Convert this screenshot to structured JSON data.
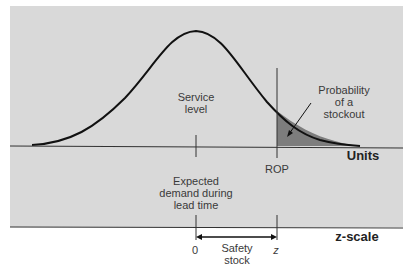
{
  "diagram": {
    "colors": {
      "panel_background": "#d9d9d9",
      "page_background": "#ffffff",
      "curve": "#111111",
      "axis": "#333333",
      "shaded_tail": "#7d7d7d"
    },
    "labels": {
      "service_level_line1": "Service",
      "service_level_line2": "level",
      "stockout_line1": "Probability",
      "stockout_line2": "of a",
      "stockout_line3": "stockout",
      "units_axis": "Units",
      "rop": "ROP",
      "expected_line1": "Expected",
      "expected_line2": "demand during",
      "expected_line3": "lead time",
      "z_scale_axis": "z-scale",
      "z_zero": "0",
      "z_value": "z",
      "safety_line1": "Safety",
      "safety_line2": "stock"
    }
  }
}
